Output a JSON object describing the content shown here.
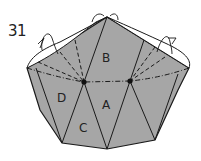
{
  "step_number": "31",
  "diagram": {
    "fill_color": "#a6a6a6",
    "line_color": "#1a1a1a",
    "labels": {
      "A": "A",
      "B": "B",
      "C": "C",
      "D": "D"
    }
  }
}
